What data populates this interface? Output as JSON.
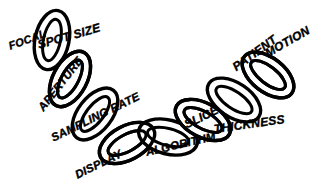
{
  "figure": {
    "type": "chain-diagram",
    "background_color": "#ffffff",
    "ink_color": "#000000",
    "link_count": 8
  },
  "labels": [
    {
      "id": "focal-spot-size",
      "text_line1": "FOCAL",
      "text_line2": "SPOT SIZE",
      "full": "FOCAL SPOT SIZE"
    },
    {
      "id": "aperture",
      "text": "APERTURE"
    },
    {
      "id": "sampling-rate",
      "text": "SAMPLING RATE"
    },
    {
      "id": "display",
      "text": "DISPLAY"
    },
    {
      "id": "algorithm",
      "text": "ALGORITHM"
    },
    {
      "id": "slice-thickness",
      "text_line1": "SLICE",
      "text_line2": "THICKNESS",
      "full": "SLICE THICKNESS"
    },
    {
      "id": "patient-motion",
      "text_line1": "PATIENT",
      "text_line2": "MOTION",
      "full": "PATIENT MOTION"
    }
  ],
  "label_text": {
    "focal": "FOCAL",
    "spot_size": "SPOT SIZE",
    "aperture": "APERTURE",
    "sampling_rate": "SAMPLING RATE",
    "display": "DISPLAY",
    "algorithm": "ALGORITHM",
    "slice": "SLICE",
    "thickness": "THICKNESS",
    "patient": "PATIENT",
    "motion": "MOTION"
  }
}
